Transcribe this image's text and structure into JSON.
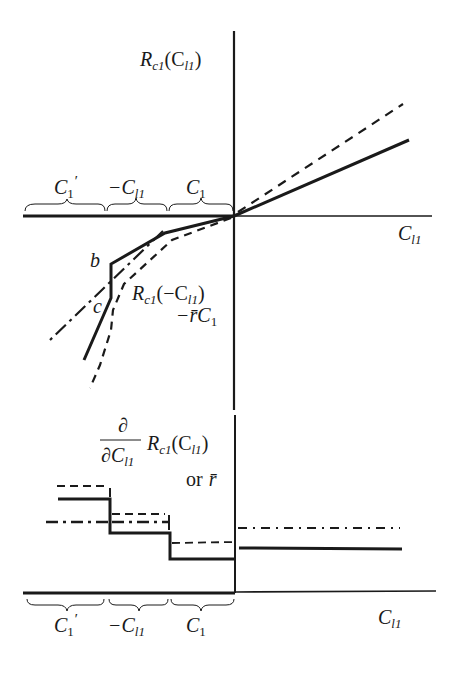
{
  "top_panel": {
    "y_axis_label": {
      "main": "R",
      "sub": "c1",
      "arg": "(C",
      "arg_sub": "l1",
      "close": ")"
    },
    "x_axis_label": {
      "main": "C",
      "sub": "l1"
    },
    "intervals": [
      {
        "main": "C",
        "sub": "1",
        "sup": "′"
      },
      {
        "main": "−C",
        "sub": "l1",
        "sup": ""
      },
      {
        "main": "C",
        "sub": "1",
        "sup": ""
      }
    ],
    "point_labels": {
      "b": "b",
      "c": "c"
    },
    "annotation": {
      "line1_main": "R",
      "line1_sub": "c1",
      "line1_arg": "(−C",
      "line1_arg_sub": "l1",
      "line1_close": ")",
      "line2_main": "−r̄C",
      "line2_sub": "1"
    }
  },
  "bottom_panel": {
    "y_axis_label": {
      "frac_num": "∂",
      "frac_den_main": "∂C",
      "frac_den_sub": "l1",
      "main": "R",
      "sub": "c1",
      "arg": "(C",
      "arg_sub": "l1",
      "close": ")",
      "or_text": "or",
      "rbar": "r̄"
    },
    "x_axis_label": {
      "main": "C",
      "sub": "l1"
    },
    "intervals": [
      {
        "main": "C",
        "sub": "1",
        "sup": "′"
      },
      {
        "main": "−C",
        "sub": "l1",
        "sup": ""
      },
      {
        "main": "C",
        "sub": "1",
        "sup": ""
      }
    ]
  },
  "line_styles": {
    "solid": "#1a1a1a",
    "dashed": "#1a1a1a",
    "dash_dot": "#1a1a1a"
  }
}
